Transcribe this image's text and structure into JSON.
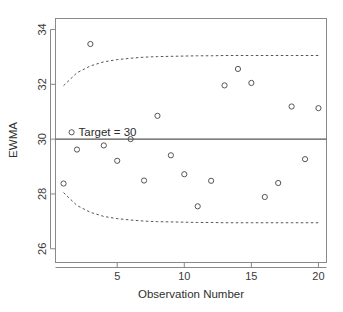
{
  "chart_data": {
    "type": "scatter",
    "title": "",
    "xlabel": "Observation Number",
    "ylabel": "EWMA",
    "xlim": [
      0.4,
      20.6
    ],
    "ylim": [
      25.5,
      34.4
    ],
    "xticks": [
      5,
      10,
      15,
      20
    ],
    "xtick_labels": [
      "5",
      "10",
      "15",
      "20"
    ],
    "yticks": [
      26,
      28,
      30,
      32,
      34
    ],
    "ytick_labels": [
      "26",
      "28",
      "30",
      "32",
      "34"
    ],
    "grid": false,
    "legend": false,
    "x": [
      1,
      2,
      3,
      4,
      5,
      6,
      7,
      8,
      9,
      10,
      11,
      12,
      13,
      14,
      15,
      16,
      17,
      18,
      19,
      20
    ],
    "values": [
      28.38,
      29.62,
      33.47,
      29.77,
      29.21,
      30.0,
      28.49,
      30.85,
      29.41,
      28.72,
      27.55,
      28.48,
      31.96,
      32.56,
      32.05,
      27.89,
      28.4,
      31.19,
      29.27,
      31.13
    ],
    "point_marker": "open-circle",
    "center_line": {
      "label": "Target = 30",
      "value": 30,
      "style": "solid"
    },
    "upper_control_limit": {
      "label": "UCL",
      "style": "dashed",
      "values": [
        31.95,
        32.42,
        32.67,
        32.82,
        32.9,
        32.95,
        32.99,
        33.01,
        33.02,
        33.03,
        33.04,
        33.04,
        33.05,
        33.05,
        33.05,
        33.05,
        33.05,
        33.05,
        33.05,
        33.05
      ]
    },
    "lower_control_limit": {
      "label": "LCL",
      "style": "dashed",
      "values": [
        28.05,
        27.58,
        27.33,
        27.18,
        27.1,
        27.05,
        27.01,
        26.99,
        26.98,
        26.97,
        26.96,
        26.96,
        26.95,
        26.95,
        26.95,
        26.95,
        26.95,
        26.95,
        26.95,
        26.95
      ]
    },
    "annotations": [
      {
        "text": "Target = 30",
        "x": 1.6,
        "y": 30.25,
        "marker": "open-circle"
      }
    ],
    "colors": {
      "point_stroke": "#555555",
      "center_line": "#555555",
      "limit_line": "#555555",
      "axis": "#888888",
      "text": "#2e2e2e",
      "background": "#ffffff"
    }
  }
}
